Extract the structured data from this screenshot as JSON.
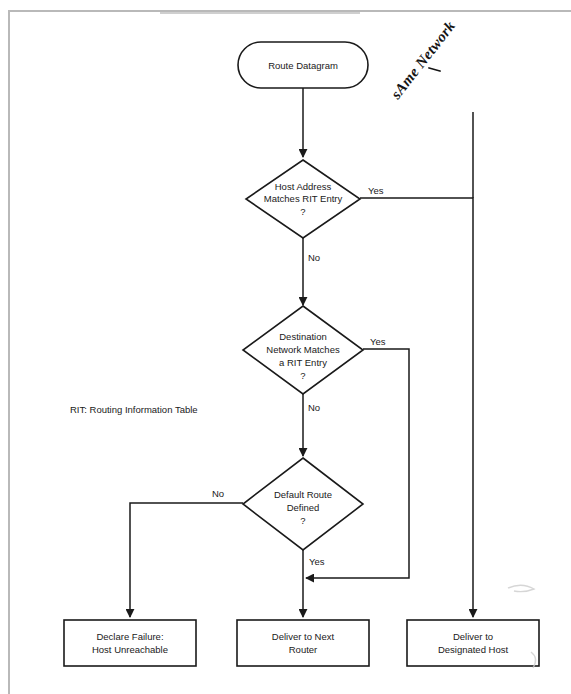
{
  "diagram": {
    "type": "flowchart",
    "title": "Route Datagram",
    "legend": "RIT: Routing Information Table",
    "handwritten_note": "sAme Network",
    "nodes": {
      "start": {
        "label": "Route Datagram",
        "shape": "terminator"
      },
      "decision1": {
        "lines": [
          "Host Address",
          "Matches RIT Entry",
          "?"
        ],
        "line1": "Host Address",
        "line2": "Matches RIT Entry",
        "line3": "?",
        "shape": "decision"
      },
      "decision2": {
        "lines": [
          "Destination",
          "Network Matches",
          "a RIT Entry",
          "?"
        ],
        "line1": "Destination",
        "line2": "Network Matches",
        "line3": "a RIT Entry",
        "line4": "?",
        "shape": "decision"
      },
      "decision3": {
        "lines": [
          "Default Route",
          "Defined",
          "?"
        ],
        "line1": "Default Route",
        "line2": "Defined",
        "line3": "?",
        "shape": "decision"
      },
      "out_failure": {
        "line1": "Declare Failure:",
        "line2": "Host Unreachable",
        "shape": "process"
      },
      "out_next_router": {
        "line1": "Deliver to Next",
        "line2": "Router",
        "shape": "process"
      },
      "out_designated_host": {
        "line1": "Deliver to",
        "line2": "Designated Host",
        "shape": "process"
      }
    },
    "edge_labels": {
      "d1_yes": "Yes",
      "d1_no": "No",
      "d2_yes": "Yes",
      "d2_no": "No",
      "d3_yes": "Yes",
      "d3_no": "No"
    },
    "colors": {
      "stroke": "#1a1a1a",
      "fill": "#ffffff",
      "highlight": "#a8a8a8",
      "page_border": "#b9b9b9"
    }
  }
}
